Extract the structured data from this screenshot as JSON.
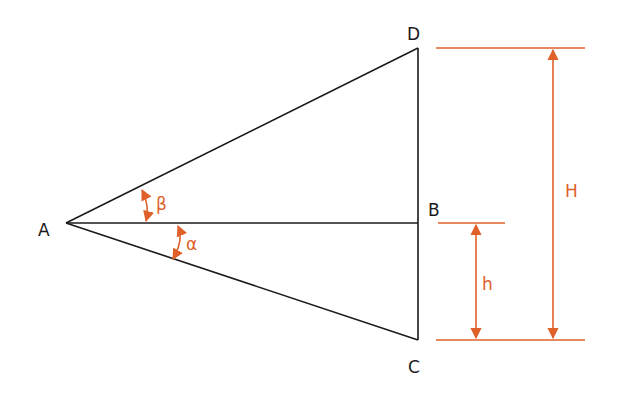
{
  "diagram": {
    "type": "triangulation-height-measurement",
    "points": {
      "A": {
        "label": "A",
        "x": 66,
        "y": 223
      },
      "B": {
        "label": "B",
        "x": 418,
        "y": 223
      },
      "C": {
        "label": "C",
        "x": 418,
        "y": 340
      },
      "D": {
        "label": "D",
        "x": 418,
        "y": 48
      }
    },
    "angles": {
      "alpha": {
        "label": "α"
      },
      "beta": {
        "label": "β"
      }
    },
    "dimensions": {
      "H": {
        "label": "H"
      },
      "h": {
        "label": "h"
      }
    },
    "colors": {
      "line": "#1a1a1a",
      "accent": "#e0602a",
      "background": "#ffffff"
    }
  }
}
